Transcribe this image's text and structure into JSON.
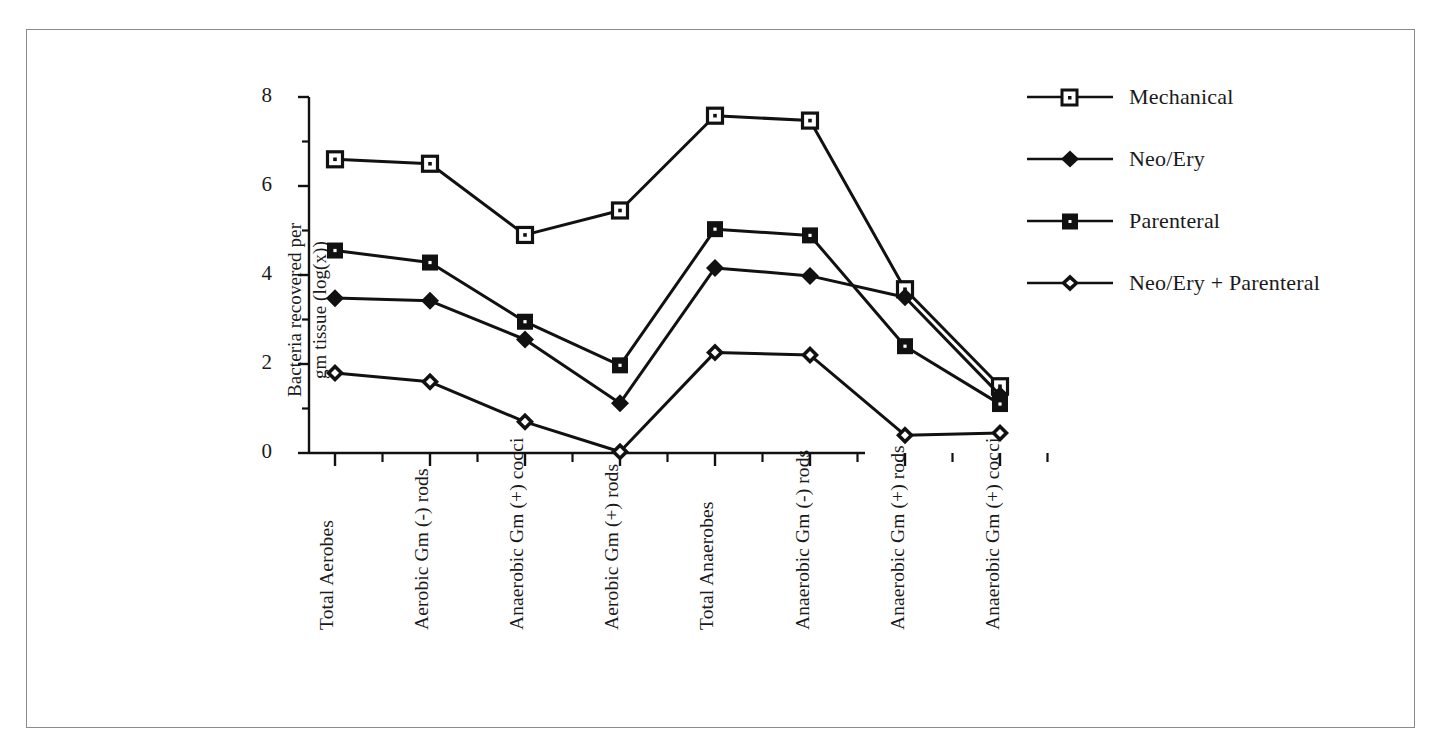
{
  "figure": {
    "frame_color": "#8a8a90",
    "background": "#ffffff",
    "line_color": "#111111"
  },
  "chart_data": {
    "type": "line",
    "title": "",
    "xlabel": "",
    "ylabel": "Bacteria recovered per gm tissue (log(x))",
    "ylabel_line1": "Bacteria recovered per",
    "ylabel_line2": "gm tissue (log(x))",
    "ylim": [
      0,
      8
    ],
    "yticks": [
      0,
      2,
      4,
      6,
      8
    ],
    "ytick_labels": [
      "0",
      "2",
      "4",
      "6",
      "8"
    ],
    "yminor_ticks": [
      1,
      3,
      5,
      7
    ],
    "grid": false,
    "legend_position": "right-top",
    "categories": [
      "Total Aerobes",
      "Aerobic Gm (-) rods",
      "Anaerobic Gm (+) cocci",
      "Aerobic Gm (+) rods",
      "Total Anaerobes",
      "Anaerobic Gm (-) rods",
      "Anaerobic Gm (+) rods",
      "Anaerobic Gm (+) cocci"
    ],
    "series": [
      {
        "name": "Mechanical",
        "marker": "open-square",
        "values": [
          6.6,
          6.5,
          4.9,
          5.45,
          7.58,
          7.47,
          3.68,
          1.5
        ]
      },
      {
        "name": "Neo/Ery",
        "marker": "filled-diamond",
        "values": [
          3.48,
          3.42,
          2.55,
          1.12,
          4.16,
          3.98,
          3.5,
          1.3
        ]
      },
      {
        "name": "Parenteral",
        "marker": "filled-square",
        "values": [
          4.55,
          4.28,
          2.95,
          1.97,
          5.03,
          4.89,
          2.4,
          1.1
        ]
      },
      {
        "name": "Neo/Ery + Parenteral",
        "marker": "open-diamond",
        "values": [
          1.8,
          1.6,
          0.7,
          0.03,
          2.26,
          2.2,
          0.4,
          0.45
        ]
      }
    ]
  },
  "legend": {
    "items": [
      {
        "label": "Mechanical",
        "marker": "open-square"
      },
      {
        "label": "Neo/Ery",
        "marker": "filled-diamond"
      },
      {
        "label": "Parenteral",
        "marker": "filled-square"
      },
      {
        "label": "Neo/Ery + Parenteral",
        "marker": "open-diamond"
      }
    ]
  }
}
